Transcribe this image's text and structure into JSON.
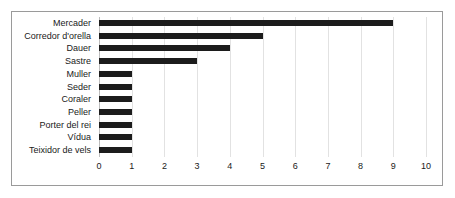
{
  "chart_data": {
    "type": "bar",
    "orientation": "horizontal",
    "title": "",
    "xlabel": "",
    "ylabel": "",
    "categories": [
      "Mercader",
      "Corredor d'orella",
      "Dauer",
      "Sastre",
      "Muller",
      "Seder",
      "Coraler",
      "Peller",
      "Porter del rei",
      "Vídua",
      "Teixidor de vels"
    ],
    "values": [
      9,
      5,
      4,
      3,
      1,
      1,
      1,
      1,
      1,
      1,
      1
    ],
    "xlim": [
      0,
      10
    ],
    "xticks": [
      0,
      1,
      2,
      3,
      4,
      5,
      6,
      7,
      8,
      9,
      10
    ],
    "xtick_labels": [
      "0",
      "1",
      "2",
      "3",
      "4",
      "5",
      "6",
      "7",
      "8",
      "9",
      "10"
    ],
    "grid": true,
    "grid_axis": "x",
    "legend": false,
    "bar_color": "#1c1c1c",
    "grid_color": "#e2e2e2",
    "frame_color": "#9a9a9a"
  }
}
